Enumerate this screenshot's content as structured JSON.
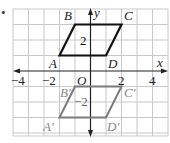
{
  "figure": {
    "bullet": "•",
    "axes": {
      "x_label": "x",
      "y_label": "y",
      "origin_label": "O",
      "x_ticks": [
        {
          "value": -4,
          "label": "−4"
        },
        {
          "value": -2,
          "label": "−2"
        },
        {
          "value": 2,
          "label": "2"
        },
        {
          "value": 4,
          "label": "4"
        }
      ],
      "x_range": [
        -5,
        5
      ],
      "y_range": [
        -4,
        4
      ]
    },
    "preimage": {
      "color": "#111111",
      "inner_label": "2",
      "vertices": [
        {
          "name": "A",
          "x": -2,
          "y": 1
        },
        {
          "name": "B",
          "x": -1,
          "y": 3
        },
        {
          "name": "C",
          "x": 2,
          "y": 3
        },
        {
          "name": "D",
          "x": 1,
          "y": 1
        }
      ]
    },
    "image": {
      "color": "#7a7a7a",
      "inner_label": "−2",
      "vertices": [
        {
          "name": "A′",
          "x": -2,
          "y": -3
        },
        {
          "name": "B′",
          "x": -1,
          "y": -1
        },
        {
          "name": "C′",
          "x": 2,
          "y": -1
        },
        {
          "name": "D′",
          "x": 1,
          "y": -3
        }
      ]
    },
    "colors": {
      "grid": "#c8c8c8",
      "axis": "#222222"
    }
  }
}
